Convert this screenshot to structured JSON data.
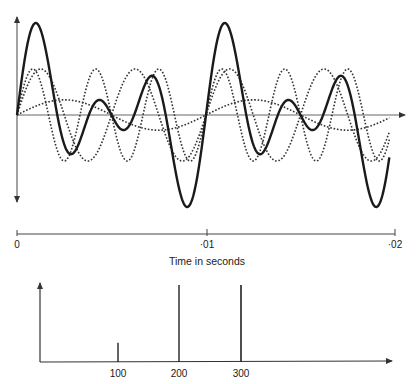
{
  "chart_data": [
    {
      "type": "line",
      "title": "",
      "xlabel": "Time in seconds",
      "ylabel": "",
      "xlim": [
        0,
        0.0205
      ],
      "x_ticks": [
        {
          "value": 0,
          "label": "0"
        },
        {
          "value": 0.01,
          "label": "·01"
        },
        {
          "value": 0.02,
          "label": "·02"
        }
      ],
      "grid": false,
      "legend": null,
      "series": [
        {
          "name": "100 Hz component",
          "style": "dotted",
          "frequency_hz": 100,
          "amplitude": 0.33,
          "phase_deg": 0
        },
        {
          "name": "200 Hz component",
          "style": "dotted",
          "frequency_hz": 200,
          "amplitude": 1.0,
          "phase_deg": 0
        },
        {
          "name": "300 Hz component",
          "style": "dotted",
          "frequency_hz": 300,
          "amplitude": 1.0,
          "phase_deg": 0
        },
        {
          "name": "Resultant wave (sum)",
          "style": "solid",
          "frequency_hz": 100,
          "components": [
            "100 Hz component",
            "200 Hz component",
            "300 Hz component"
          ]
        }
      ]
    },
    {
      "type": "bar",
      "title": "",
      "subtype": "line spectrum",
      "xlabel": "",
      "ylabel": "",
      "categories": [
        "100",
        "200",
        "300"
      ],
      "values": [
        0.25,
        1.0,
        1.0
      ],
      "grid": false,
      "legend": null
    }
  ],
  "labels": {
    "time_axis": {
      "t0": "0",
      "t1": "·01",
      "t2": "·02",
      "title": "Time in seconds"
    },
    "spectrum_axis": {
      "f100": "100",
      "f200": "200",
      "f300": "300"
    }
  },
  "colors": {
    "ink": "#1a1a1a",
    "axis": "#555555",
    "background": "#ffffff"
  }
}
